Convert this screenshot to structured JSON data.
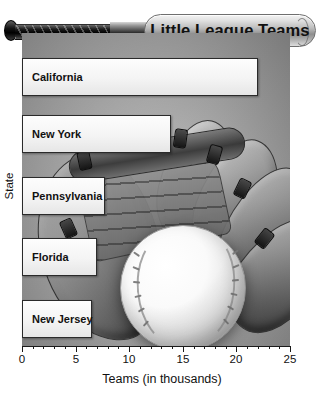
{
  "chart_data": {
    "type": "bar",
    "orientation": "horizontal",
    "title": "Little League Teams",
    "xlabel": "Teams (in thousands)",
    "ylabel": "State",
    "categories": [
      "California",
      "New York",
      "Pennsylvania",
      "Florida",
      "New Jersey"
    ],
    "values": [
      22.5,
      14.3,
      8.0,
      7.2,
      6.7
    ],
    "xlim": [
      0,
      25
    ],
    "xticks": [
      0,
      5,
      10,
      15,
      20,
      25
    ],
    "xticklabels": [
      "0",
      "5",
      "10",
      "15",
      "20",
      "25"
    ],
    "minor_ticks_per_interval": 5,
    "grid": false,
    "legend": null,
    "bar_color": "#f6f6f6",
    "bar_edge_color": "#2a2a2a",
    "panel_color": "#ababab",
    "background_image": "baseball-glove-and-ball"
  },
  "decor": {
    "bat_label": "baseball-bat-title-banner",
    "glove_label": "baseball-glove",
    "ball_label": "baseball"
  }
}
